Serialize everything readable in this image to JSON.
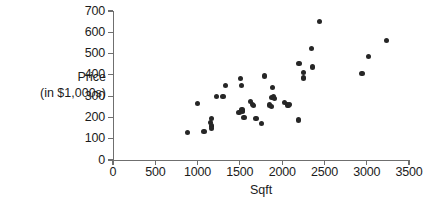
{
  "chart_data": {
    "type": "scatter",
    "title": "",
    "xlabel": "Sqft",
    "ylabel": "Price (in $1,000s)",
    "ylabel_lines": [
      "Price",
      "(in $1,000s)"
    ],
    "xlim": [
      0,
      3500
    ],
    "ylim": [
      0,
      700
    ],
    "xticks": [
      0,
      500,
      1000,
      1500,
      2000,
      2500,
      3000,
      3500
    ],
    "yticks": [
      0,
      100,
      200,
      300,
      400,
      500,
      600,
      700
    ],
    "xtick_labels": [
      "0",
      "500",
      "1000",
      "1500",
      "2000",
      "2500",
      "3000",
      "3500"
    ],
    "ytick_labels": [
      "0",
      "100",
      "200",
      "300",
      "400",
      "500",
      "600",
      "700"
    ],
    "grid": false,
    "legend": null,
    "marker_color": "#262626",
    "axis_color": "#6f6f6f",
    "points": [
      {
        "x": 880,
        "y": 128
      },
      {
        "x": 1000,
        "y": 265
      },
      {
        "x": 1075,
        "y": 132
      },
      {
        "x": 1160,
        "y": 195
      },
      {
        "x": 1155,
        "y": 178
      },
      {
        "x": 1160,
        "y": 160
      },
      {
        "x": 1165,
        "y": 148
      },
      {
        "x": 1225,
        "y": 300
      },
      {
        "x": 1300,
        "y": 300
      },
      {
        "x": 1335,
        "y": 350
      },
      {
        "x": 1490,
        "y": 225
      },
      {
        "x": 1510,
        "y": 383
      },
      {
        "x": 1515,
        "y": 350
      },
      {
        "x": 1525,
        "y": 235
      },
      {
        "x": 1530,
        "y": 228
      },
      {
        "x": 1550,
        "y": 200
      },
      {
        "x": 1625,
        "y": 275
      },
      {
        "x": 1650,
        "y": 262
      },
      {
        "x": 1665,
        "y": 255
      },
      {
        "x": 1690,
        "y": 196
      },
      {
        "x": 1760,
        "y": 170
      },
      {
        "x": 1790,
        "y": 395
      },
      {
        "x": 1855,
        "y": 258
      },
      {
        "x": 1870,
        "y": 250
      },
      {
        "x": 1880,
        "y": 295
      },
      {
        "x": 1885,
        "y": 340
      },
      {
        "x": 1900,
        "y": 300
      },
      {
        "x": 1905,
        "y": 288
      },
      {
        "x": 2030,
        "y": 272
      },
      {
        "x": 2060,
        "y": 258
      },
      {
        "x": 2075,
        "y": 255
      },
      {
        "x": 2085,
        "y": 262
      },
      {
        "x": 2195,
        "y": 188
      },
      {
        "x": 2200,
        "y": 452
      },
      {
        "x": 2250,
        "y": 412
      },
      {
        "x": 2255,
        "y": 385
      },
      {
        "x": 2350,
        "y": 525
      },
      {
        "x": 2355,
        "y": 437
      },
      {
        "x": 2440,
        "y": 650
      },
      {
        "x": 2945,
        "y": 405
      },
      {
        "x": 3025,
        "y": 488
      },
      {
        "x": 3230,
        "y": 562
      }
    ]
  }
}
